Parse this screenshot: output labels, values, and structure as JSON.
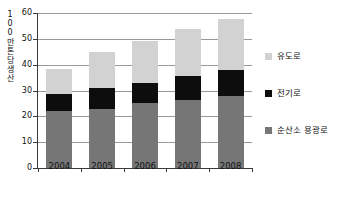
{
  "chart_data": {
    "type": "bar",
    "subtype": "stacked-vertical",
    "title": "",
    "xlabel": "",
    "ylabel": "100만톤 생산",
    "ylabel_chars": [
      "1",
      "0",
      "0",
      "만",
      "톤",
      "당",
      "생",
      "산"
    ],
    "categories": [
      "2004",
      "2005",
      "2006",
      "2007",
      "2008"
    ],
    "ylim": [
      0,
      60
    ],
    "yticks": [
      0,
      10,
      20,
      30,
      40,
      50,
      60
    ],
    "ytick_labels": [
      "0",
      "10",
      "20",
      "30",
      "40",
      "50",
      "60"
    ],
    "grid": true,
    "grid_axis": "y",
    "legend_position": "right",
    "stack_order_bottom_to_top": [
      "순산소 용광로",
      "전기로",
      "유도로"
    ],
    "series": [
      {
        "name": "순산소 용광로",
        "color": "#767676",
        "values": [
          22.0,
          23.0,
          25.0,
          26.5,
          28.0
        ]
      },
      {
        "name": "전기로",
        "color": "#0d0d0d",
        "values": [
          6.5,
          8.0,
          8.0,
          9.0,
          10.0
        ]
      },
      {
        "name": "유도로",
        "color": "#d2d2d2",
        "values": [
          10.0,
          14.0,
          16.0,
          18.5,
          19.5
        ]
      }
    ],
    "cumulative_tops": [
      [
        22.0,
        28.5,
        38.5
      ],
      [
        23.0,
        31.0,
        45.0
      ],
      [
        25.0,
        33.0,
        49.0
      ],
      [
        26.5,
        35.5,
        54.0
      ],
      [
        28.0,
        38.0,
        57.5
      ]
    ],
    "totals": [
      38.5,
      45.0,
      49.0,
      54.0,
      57.5
    ]
  },
  "legend": {
    "items": [
      {
        "label": "유도로",
        "color": "#d2d2d2"
      },
      {
        "label": "전기로",
        "color": "#0d0d0d"
      },
      {
        "label": "순산소 용광로",
        "color": "#767676"
      }
    ]
  },
  "colors": {
    "axis": "#3a3a3a",
    "grid": "#9a9a9a",
    "background": "#ffffff",
    "text": "#111111"
  }
}
